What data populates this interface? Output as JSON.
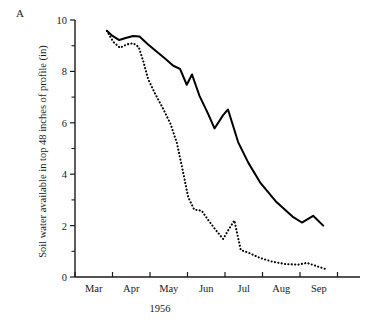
{
  "figure": {
    "panel_label": "A",
    "y_axis_title": "Soil water available in top 48 inches of profile (in)",
    "x_axis_title": "1956"
  },
  "chart_data": {
    "type": "line",
    "title": "",
    "subtitle": "",
    "panel": "A",
    "xlabel": "1956",
    "ylabel": "Soil water available in top 48 inches of profile (in)",
    "xlim": [
      0,
      7.6
    ],
    "ylim": [
      0,
      10
    ],
    "grid": false,
    "legend": "none",
    "y_ticks_major": [
      0,
      2,
      4,
      6,
      8,
      10
    ],
    "y_ticks_minor": [
      1,
      3,
      5,
      7,
      9
    ],
    "y_tick_labels": [
      "0",
      "2",
      "4",
      "6",
      "8",
      "10"
    ],
    "x_tick_positions": [
      0,
      1,
      2,
      3,
      4,
      5,
      6,
      7
    ],
    "x_categories": [
      "Mar",
      "Apr",
      "May",
      "Jun",
      "Jul",
      "Aug",
      "Sep"
    ],
    "x_unit_note": "x is in months from start of Mar; month labels centred between ticks",
    "series": [
      {
        "name": "solid",
        "style": "solid",
        "color": "#000000",
        "points": [
          [
            0.85,
            9.58
          ],
          [
            1.0,
            9.38
          ],
          [
            1.18,
            9.22
          ],
          [
            1.35,
            9.3
          ],
          [
            1.55,
            9.38
          ],
          [
            1.72,
            9.36
          ],
          [
            1.95,
            9.05
          ],
          [
            2.15,
            8.8
          ],
          [
            2.4,
            8.5
          ],
          [
            2.62,
            8.22
          ],
          [
            2.8,
            8.1
          ],
          [
            2.98,
            7.48
          ],
          [
            3.12,
            7.88
          ],
          [
            3.32,
            7.05
          ],
          [
            3.55,
            6.35
          ],
          [
            3.72,
            5.78
          ],
          [
            3.95,
            6.3
          ],
          [
            4.08,
            6.52
          ],
          [
            4.35,
            5.25
          ],
          [
            4.62,
            4.45
          ],
          [
            4.95,
            3.65
          ],
          [
            5.35,
            2.95
          ],
          [
            5.8,
            2.35
          ],
          [
            6.05,
            2.12
          ],
          [
            6.35,
            2.38
          ],
          [
            6.62,
            2.0
          ]
        ]
      },
      {
        "name": "dotted",
        "style": "dotted",
        "color": "#000000",
        "points": [
          [
            0.85,
            9.58
          ],
          [
            1.02,
            9.15
          ],
          [
            1.2,
            8.92
          ],
          [
            1.38,
            9.05
          ],
          [
            1.55,
            9.1
          ],
          [
            1.7,
            8.95
          ],
          [
            1.82,
            8.4
          ],
          [
            1.95,
            7.7
          ],
          [
            2.12,
            7.18
          ],
          [
            2.35,
            6.55
          ],
          [
            2.55,
            5.95
          ],
          [
            2.72,
            5.2
          ],
          [
            2.88,
            4.1
          ],
          [
            3.02,
            3.1
          ],
          [
            3.18,
            2.62
          ],
          [
            3.38,
            2.58
          ],
          [
            3.55,
            2.22
          ],
          [
            3.78,
            1.78
          ],
          [
            3.95,
            1.48
          ],
          [
            4.12,
            1.9
          ],
          [
            4.25,
            2.2
          ],
          [
            4.42,
            1.05
          ],
          [
            4.62,
            0.95
          ],
          [
            4.92,
            0.75
          ],
          [
            5.25,
            0.6
          ],
          [
            5.62,
            0.5
          ],
          [
            5.95,
            0.48
          ],
          [
            6.18,
            0.55
          ],
          [
            6.45,
            0.42
          ],
          [
            6.7,
            0.3
          ]
        ]
      }
    ]
  }
}
